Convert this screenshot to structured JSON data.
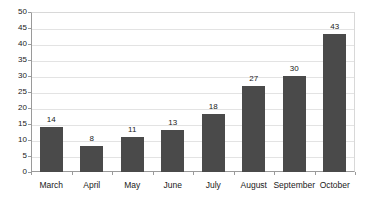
{
  "chart_data": {
    "type": "bar",
    "title": "",
    "subtitle": "",
    "xlabel": "",
    "ylabel": "",
    "categories": [
      "March",
      "April",
      "May",
      "June",
      "July",
      "August",
      "September",
      "October"
    ],
    "values": [
      14,
      8,
      11,
      13,
      18,
      27,
      30,
      43
    ],
    "value_labels": [
      "14",
      "8",
      "11",
      "13",
      "18",
      "27",
      "30",
      "43"
    ],
    "ylim": [
      0,
      50
    ],
    "ytick_step": 5,
    "yticks": [
      0,
      5,
      10,
      15,
      20,
      25,
      30,
      35,
      40,
      45,
      50
    ],
    "ytick_labels": [
      "0",
      "5",
      "10",
      "15",
      "20",
      "25",
      "30",
      "35",
      "40",
      "45",
      "50"
    ],
    "grid": true,
    "grid_axis": "y",
    "legend": false,
    "legend_position": "none",
    "series": [
      {
        "name": "",
        "values": [
          14,
          8,
          11,
          13,
          18,
          27,
          30,
          43
        ],
        "color": "#4a4a4a"
      }
    ],
    "colors": {
      "bar": "#4a4a4a",
      "gridline": "#e3e3e3",
      "axis": "#9a9a9a",
      "text": "#1a1a1a",
      "background": "#ffffff",
      "plot_border": "#d8d8d8"
    }
  }
}
